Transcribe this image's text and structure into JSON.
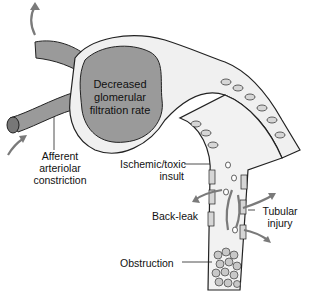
{
  "diagram": {
    "type": "kidney nephron pathophysiology",
    "colors": {
      "glomerulus": "#9a9a9a",
      "tubule_lumen": "#f2f2f2",
      "cell_fill": "#d6d6d6",
      "arrow": "#7a7a7a",
      "outline": "#222222"
    },
    "labels": {
      "gfr_line1": "Decreased",
      "gfr_line2": "glomerular",
      "gfr_line3": "filtration rate",
      "afferent_line1": "Afferent",
      "afferent_line2": "arteriolar",
      "afferent_line3": "constriction",
      "ischemic_line1": "Ischemic/toxic",
      "ischemic_line2": "insult",
      "backleak": "Back-leak",
      "tubular_line1": "Tubular",
      "tubular_line2": "injury",
      "obstruction": "Obstruction"
    }
  }
}
